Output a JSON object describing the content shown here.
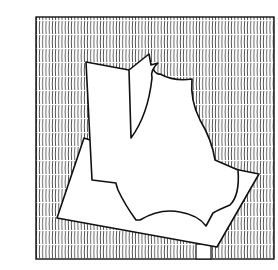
{
  "illustration": {
    "subject": "abstract cut-paper shapes on hatched background",
    "colors": {
      "background": "#ffffff",
      "ink": "#111111",
      "paper": "#ffffff"
    },
    "frame": {
      "x": 36,
      "y": 17,
      "width": 238,
      "height": 242
    },
    "hatch_spacing": 3
  }
}
